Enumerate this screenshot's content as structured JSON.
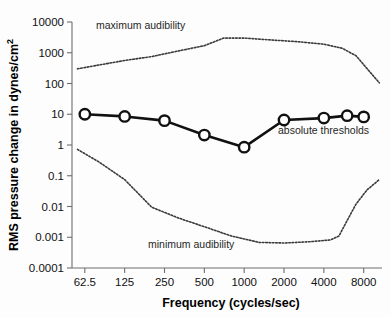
{
  "chart_data": {
    "type": "line",
    "title": "",
    "xlabel": "Frequency (cycles/sec)",
    "ylabel": "RMS pressure change in dynes/cm",
    "ylabel_superscript": "2",
    "xscale": "log",
    "yscale": "log",
    "xlim": [
      50,
      11000
    ],
    "ylim": [
      0.0001,
      10000
    ],
    "grid": false,
    "legend_position": "inline-annotations",
    "xticks": [
      62.5,
      125,
      250,
      500,
      1000,
      2000,
      4000,
      8000
    ],
    "xtick_labels": [
      "62.5",
      "125",
      "250",
      "500",
      "1000",
      "2000",
      "4000",
      "8000"
    ],
    "yticks": [
      0.0001,
      0.001,
      0.01,
      0.1,
      1,
      10,
      100,
      1000,
      10000
    ],
    "ytick_labels": [
      "0.0001",
      "0.001",
      "0.01",
      "0.1",
      "1",
      "10",
      "100",
      "1000",
      "10000"
    ],
    "series": [
      {
        "name": "absolute thresholds",
        "style": "solid-with-circle-markers",
        "color": "#111111",
        "x": [
          62.5,
          125,
          250,
          500,
          1000,
          2000,
          4000,
          6000,
          8000
        ],
        "values": [
          10.0,
          8.5,
          6.2,
          2.1,
          0.85,
          6.5,
          7.5,
          9.0,
          8.2
        ]
      },
      {
        "name": "maximum audibility",
        "style": "dotted",
        "color": "#3a3a3a",
        "x": [
          55,
          80,
          125,
          200,
          320,
          500,
          700,
          1000,
          1600,
          2500,
          4000,
          5500,
          7000,
          8500,
          10500
        ],
        "values": [
          300,
          400,
          560,
          750,
          1150,
          1700,
          3000,
          3000,
          2600,
          2300,
          1900,
          1400,
          800,
          300,
          105
        ]
      },
      {
        "name": "minimum audibility",
        "style": "dotted",
        "color": "#3a3a3a",
        "x": [
          55,
          80,
          125,
          200,
          320,
          500,
          800,
          1300,
          2000,
          3200,
          4500,
          5200,
          6000,
          7000,
          8500,
          10500
        ],
        "values": [
          0.72,
          0.28,
          0.075,
          0.0095,
          0.0042,
          0.0022,
          0.0011,
          0.00068,
          0.00065,
          0.00072,
          0.00082,
          0.0011,
          0.0035,
          0.012,
          0.035,
          0.075
        ]
      }
    ],
    "annotations": [
      {
        "id": "maximum-audibility",
        "text": "maximum audibility",
        "x_px": 96,
        "y_px": 29
      },
      {
        "id": "absolute-thresholds",
        "text": "absolute thresholds",
        "x_px": 278,
        "y_px": 134
      },
      {
        "id": "minimum-audibility",
        "text": "minimum audibility",
        "x_px": 148,
        "y_px": 248
      }
    ]
  }
}
